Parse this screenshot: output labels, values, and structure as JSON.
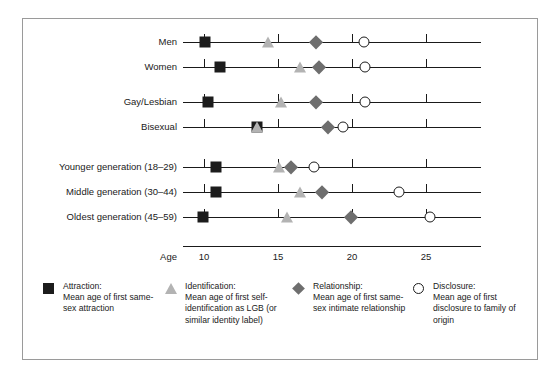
{
  "chart_data": {
    "type": "scatter",
    "title": "",
    "xlabel": "Age",
    "ylabel": "",
    "xlim": [
      8.0,
      27.0
    ],
    "xticks": [
      10,
      15,
      20,
      25
    ],
    "xtick_labels": [
      "10",
      "15",
      "20",
      "25"
    ],
    "grid": false,
    "legend_position": "bottom",
    "categories": [
      "Men",
      "Women",
      "Gay/Lesbian",
      "Bisexual",
      "Younger generation (18–29)",
      "Middle generation (30–44)",
      "Oldest generation (45–59)"
    ],
    "series": [
      {
        "name": "Attraction",
        "marker": "square",
        "color": "#1c1c1c",
        "values": [
          10.1,
          11.1,
          10.3,
          13.6,
          10.8,
          10.8,
          9.9
        ]
      },
      {
        "name": "Identification",
        "marker": "triangle",
        "color": "#b3b3b3",
        "values": [
          14.3,
          16.5,
          15.2,
          13.6,
          15.1,
          16.5,
          15.6
        ]
      },
      {
        "name": "Relationship",
        "marker": "diamond",
        "color": "#6e6e6e",
        "values": [
          17.6,
          17.8,
          17.6,
          18.4,
          15.9,
          18.0,
          19.9
        ]
      },
      {
        "name": "Disclosure",
        "marker": "circle",
        "color": "#1c1c1c",
        "values": [
          20.8,
          20.9,
          20.9,
          19.4,
          17.4,
          23.2,
          25.3
        ]
      }
    ]
  },
  "axis": {
    "name": "Age",
    "ticks": [
      "10",
      "15",
      "20",
      "25"
    ]
  },
  "rows": [
    {
      "label": "Men"
    },
    {
      "label": "Women"
    },
    {
      "label": "Gay/Lesbian"
    },
    {
      "label": "Bisexual"
    },
    {
      "label": "Younger generation (18–29)"
    },
    {
      "label": "Middle generation (30–44)"
    },
    {
      "label": "Oldest generation (45–59)"
    }
  ],
  "legend": [
    {
      "symbol": "square",
      "title": "Attraction:",
      "description": "Mean age of first same-sex attraction"
    },
    {
      "symbol": "triangle",
      "title": "Identification:",
      "description": "Mean age of first self-identification as LGB (or similar identity label)"
    },
    {
      "symbol": "diamond",
      "title": "Relationship:",
      "description": "Mean age of first same-sex intimate relationship"
    },
    {
      "symbol": "circle",
      "title": "Disclosure:",
      "description": "Mean age of first disclosure to family of origin"
    }
  ]
}
